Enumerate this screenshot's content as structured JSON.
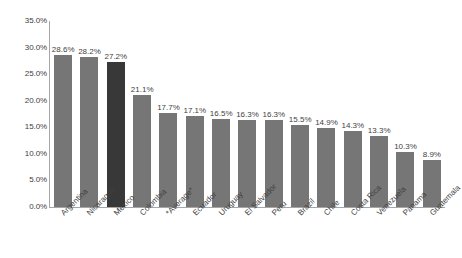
{
  "chart_data": {
    "type": "bar",
    "title": "",
    "subtitle": "",
    "xlabel": "",
    "ylabel": "",
    "ylim": [
      0,
      35
    ],
    "grid": false,
    "legend": null,
    "value_label_format": "percent-one-decimal",
    "y_tick_labels": [
      "35.0%",
      "30.0%",
      "25.0%",
      "20.0%",
      "15.0%",
      "10.0%",
      "5.0%",
      "0.0%"
    ],
    "y_tick_values": [
      35,
      30,
      25,
      20,
      15,
      10,
      5,
      0
    ],
    "categories": [
      "Argentina",
      "Nicaragua",
      "Mexico",
      "Colombia",
      "*Average*",
      "Ecuador",
      "Uruguay",
      "El Salvador",
      "Peru",
      "Brazil",
      "Chile",
      "Costa Rica",
      "Venezuela",
      "Panama",
      "Guatemala"
    ],
    "values": [
      28.6,
      28.2,
      27.2,
      21.1,
      17.7,
      17.1,
      16.5,
      16.3,
      16.3,
      15.5,
      14.9,
      14.3,
      13.3,
      10.3,
      8.9
    ],
    "value_labels": [
      "28.6%",
      "28.2%",
      "27.2%",
      "21.1%",
      "17.7%",
      "17.1%",
      "16.5%",
      "16.3%",
      "16.3%",
      "15.5%",
      "14.9%",
      "14.3%",
      "13.3%",
      "10.3%",
      "8.9%"
    ],
    "highlight_index": 2,
    "colors": {
      "bar": "#767676",
      "bar_highlight": "#383838",
      "axis": "#a6a6a6",
      "text": "#3f3f3f",
      "background": "#ffffff"
    }
  }
}
